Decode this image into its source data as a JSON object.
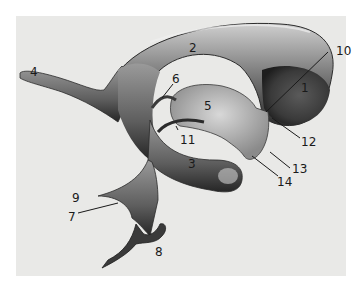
{
  "figure": {
    "background_color": "#e9e9e7",
    "shade_dark": "#2b2b2b",
    "shade_mid": "#7a7a7a",
    "shade_light": "#cfcfcf",
    "signature": "artist signature (illegible)"
  },
  "labels": [
    {
      "id": "1",
      "text": "1"
    },
    {
      "id": "2",
      "text": "2"
    },
    {
      "id": "3",
      "text": "3"
    },
    {
      "id": "4",
      "text": "4"
    },
    {
      "id": "5",
      "text": "5"
    },
    {
      "id": "6",
      "text": "6"
    },
    {
      "id": "7",
      "text": "7"
    },
    {
      "id": "8",
      "text": "8"
    },
    {
      "id": "9",
      "text": "9"
    },
    {
      "id": "10",
      "text": "10"
    },
    {
      "id": "11",
      "text": "11"
    },
    {
      "id": "12",
      "text": "12"
    },
    {
      "id": "13",
      "text": "13"
    },
    {
      "id": "14",
      "text": "14"
    }
  ]
}
